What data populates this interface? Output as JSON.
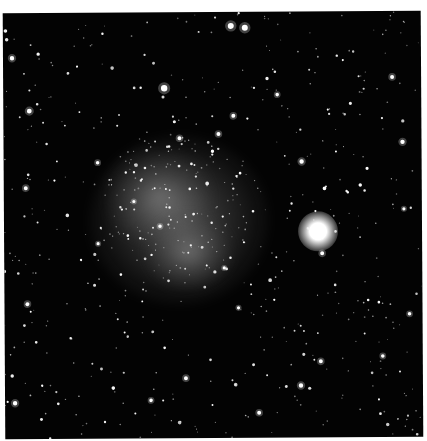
{
  "image": {
    "subject": "star field with a diffuse dwarf galaxy (nebulous cloud) and a bright globular star cluster",
    "background_color": "#ffffff",
    "field_color": "#030303",
    "cloud": {
      "cx": 175,
      "cy": 215,
      "rx": 80,
      "ry": 80,
      "color": "#969696"
    },
    "cloud_lobe": {
      "cx": 150,
      "cy": 185,
      "rx": 45,
      "ry": 45
    },
    "cluster": {
      "cx": 318,
      "cy": 226,
      "r": 14,
      "color": "#ffffff"
    },
    "bright_stars": [
      [
        232,
        26,
        3
      ],
      [
        246,
        28,
        3
      ],
      [
        165,
        88,
        3.2
      ],
      [
        322,
        254,
        2
      ],
      [
        302,
        162,
        2.2
      ],
      [
        219,
        134,
        2
      ],
      [
        393,
        78,
        2
      ],
      [
        403,
        143,
        2.2
      ],
      [
        180,
        138,
        2
      ],
      [
        234,
        116,
        2
      ],
      [
        13,
        57,
        2.2
      ],
      [
        30,
        110,
        2.4
      ],
      [
        26,
        187,
        2
      ],
      [
        27,
        303,
        2
      ],
      [
        14,
        402,
        2.2
      ],
      [
        300,
        386,
        2.2
      ],
      [
        320,
        362,
        2
      ],
      [
        185,
        378,
        2
      ],
      [
        258,
        413,
        2
      ],
      [
        150,
        400,
        1.8
      ],
      [
        409,
        315,
        1.8
      ],
      [
        404,
        210,
        1.6
      ],
      [
        382,
        357,
        1.8
      ],
      [
        278,
        95,
        1.8
      ],
      [
        98,
        162,
        1.8
      ],
      [
        134,
        201,
        1.6
      ],
      [
        160,
        226,
        1.8
      ],
      [
        224,
        268,
        1.6
      ],
      [
        98,
        243,
        1.6
      ],
      [
        238,
        308,
        1.6
      ]
    ],
    "star_seed": 7,
    "star_count": 650
  }
}
